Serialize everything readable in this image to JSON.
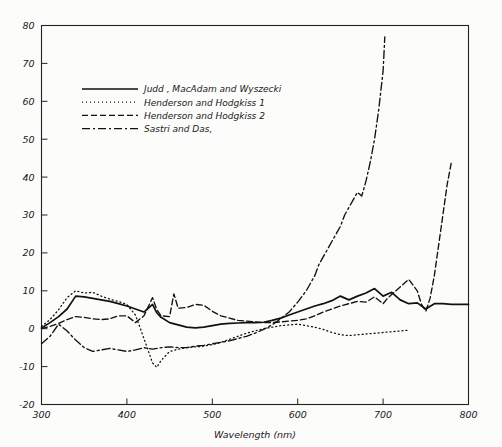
{
  "figure": {
    "background_color": "#fcfcfa",
    "line_color": "#111111"
  },
  "chart_data": {
    "type": "line",
    "title": "",
    "xlabel": "Wavelength (nm)",
    "ylabel": "",
    "xlim": [
      300,
      800
    ],
    "ylim": [
      -20,
      80
    ],
    "xticks": [
      300,
      400,
      500,
      600,
      700,
      800
    ],
    "xtick_labels": [
      "300",
      "400",
      "500",
      "600",
      "700",
      "800"
    ],
    "yticks": [
      -20,
      -10,
      0,
      10,
      20,
      30,
      40,
      50,
      60,
      70,
      80
    ],
    "ytick_labels": [
      "-20",
      "-10",
      "0",
      "10",
      "20",
      "30",
      "40",
      "50",
      "60",
      "70",
      "80"
    ],
    "grid": false,
    "legend_position": "upper-left-inside",
    "series": [
      {
        "name": "Judd , MacAdam and Wyszecki",
        "style": "solid",
        "dash": "none",
        "x": [
          300,
          310,
          320,
          330,
          340,
          350,
          360,
          370,
          380,
          390,
          400,
          410,
          420,
          430,
          435,
          440,
          450,
          460,
          470,
          480,
          490,
          500,
          510,
          520,
          530,
          540,
          550,
          560,
          570,
          580,
          590,
          600,
          610,
          620,
          630,
          640,
          650,
          660,
          670,
          680,
          690,
          700,
          710,
          720,
          730,
          740,
          750,
          760,
          770,
          780,
          790,
          800
        ],
        "y": [
          0.2,
          1.6,
          3.2,
          5.2,
          8.6,
          8.4,
          8.0,
          7.6,
          7.2,
          6.6,
          6.0,
          5.2,
          4.4,
          6.4,
          4.2,
          3.0,
          1.6,
          1.0,
          0.4,
          0.2,
          0.4,
          0.8,
          1.2,
          1.4,
          1.5,
          1.6,
          1.6,
          1.7,
          2.2,
          2.8,
          3.6,
          4.4,
          5.2,
          6.0,
          6.6,
          7.4,
          8.6,
          7.6,
          8.6,
          9.4,
          10.6,
          8.6,
          9.6,
          7.6,
          6.6,
          6.8,
          5.2,
          6.6,
          6.6,
          6.4,
          6.4,
          6.4
        ]
      },
      {
        "name": "Henderson and Hodgkiss 1",
        "style": "dotted",
        "dash": "1,3",
        "x": [
          300,
          310,
          320,
          330,
          340,
          350,
          360,
          370,
          380,
          390,
          400,
          410,
          420,
          430,
          435,
          440,
          450,
          460,
          470,
          480,
          490,
          500,
          510,
          520,
          530,
          540,
          550,
          560,
          570,
          580,
          590,
          600,
          610,
          620,
          630,
          640,
          650,
          660,
          670,
          680,
          690,
          700,
          710,
          720,
          730
        ],
        "y": [
          0.6,
          2.4,
          5.0,
          8.2,
          10.0,
          9.4,
          9.6,
          8.6,
          7.8,
          7.2,
          6.4,
          3.6,
          -2.6,
          -9.0,
          -10.2,
          -8.4,
          -6.0,
          -5.4,
          -5.0,
          -4.8,
          -4.6,
          -4.2,
          -3.6,
          -2.8,
          -2.0,
          -1.2,
          -0.6,
          0.0,
          0.4,
          0.8,
          1.0,
          1.2,
          0.8,
          0.4,
          -0.2,
          -1.0,
          -1.6,
          -1.8,
          -1.6,
          -1.4,
          -1.2,
          -1.0,
          -0.8,
          -0.6,
          -0.4
        ]
      },
      {
        "name": "Henderson and Hodgkiss 2",
        "style": "dashed",
        "dash": "6,3",
        "x": [
          300,
          310,
          320,
          330,
          340,
          350,
          360,
          370,
          380,
          390,
          400,
          410,
          420,
          430,
          435,
          440,
          450,
          455,
          460,
          470,
          480,
          490,
          500,
          510,
          520,
          530,
          540,
          550,
          560,
          570,
          580,
          590,
          600,
          610,
          620,
          630,
          640,
          650,
          660,
          670,
          680,
          690,
          700,
          705,
          710,
          720,
          730,
          740,
          745,
          750,
          755,
          760,
          765,
          770,
          775,
          780
        ],
        "y": [
          0.0,
          0.6,
          1.4,
          2.4,
          3.2,
          3.0,
          2.6,
          2.4,
          2.6,
          3.4,
          3.4,
          1.6,
          3.4,
          8.2,
          5.0,
          3.4,
          3.2,
          9.2,
          5.4,
          5.6,
          6.4,
          6.2,
          4.6,
          3.4,
          2.8,
          2.2,
          2.0,
          1.8,
          1.6,
          1.6,
          1.8,
          2.0,
          2.2,
          2.6,
          3.4,
          4.4,
          5.2,
          6.0,
          6.6,
          7.2,
          7.0,
          8.4,
          6.6,
          8.0,
          9.0,
          11.0,
          13.0,
          10.0,
          6.4,
          4.6,
          8.0,
          14.0,
          22.0,
          30.0,
          38.0,
          44.0
        ]
      },
      {
        "name": "Sastri and Das,",
        "style": "dashdot",
        "dash": "8,3,2,3",
        "x": [
          300,
          310,
          320,
          330,
          340,
          350,
          360,
          370,
          380,
          390,
          400,
          410,
          420,
          430,
          440,
          450,
          460,
          470,
          480,
          490,
          500,
          510,
          520,
          530,
          540,
          550,
          560,
          570,
          580,
          590,
          600,
          610,
          620,
          625,
          630,
          640,
          650,
          655,
          660,
          665,
          670,
          675,
          680,
          685,
          690,
          695,
          700,
          702
        ],
        "y": [
          -4.0,
          -2.0,
          1.2,
          -0.6,
          -3.0,
          -5.0,
          -6.0,
          -5.6,
          -5.2,
          -5.6,
          -6.0,
          -5.6,
          -5.0,
          -5.4,
          -5.0,
          -4.8,
          -5.0,
          -5.0,
          -4.6,
          -4.4,
          -4.0,
          -3.6,
          -3.2,
          -2.6,
          -2.0,
          -1.2,
          -0.2,
          1.0,
          2.6,
          4.4,
          7.0,
          10.0,
          14.0,
          17.0,
          19.0,
          23.0,
          27.0,
          30.0,
          32.0,
          34.0,
          36.0,
          35.0,
          39.0,
          44.0,
          50.0,
          58.0,
          68.0,
          77.0
        ]
      }
    ]
  },
  "legend": {
    "entries": [
      {
        "label": "Judd , MacAdam and Wyszecki"
      },
      {
        "label": "Henderson and Hodgkiss 1"
      },
      {
        "label": "Henderson and Hodgkiss 2"
      },
      {
        "label": "Sastri and Das,"
      }
    ]
  }
}
